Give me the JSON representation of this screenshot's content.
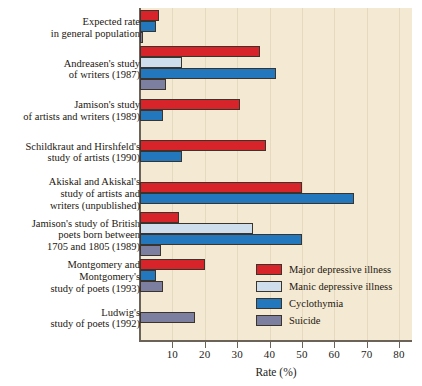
{
  "chart_data": {
    "type": "bar",
    "orientation": "horizontal",
    "title": "",
    "xlabel": "Rate (%)",
    "ylabel": "",
    "xlim": [
      0,
      84
    ],
    "xticks": [
      10,
      20,
      30,
      40,
      50,
      60,
      70,
      80
    ],
    "grid": true,
    "legend_position": "inside-right",
    "categories": [
      "Expected rate\nin general population",
      "Andreasen's study\nof writers (1987)",
      "Jamison's study\nof artists and writers (1989)",
      "Schildkraut and Hirshfeld's\nstudy of artists (1990)",
      "Akiskal and Akiskal's\nstudy of artists and\nwriters  (unpublished)",
      "Jamison's study of British\npoets born between\n1705 and 1805 (1989)",
      "Montgomery and\nMontgomery's\nstudy of poets (1993)",
      "Ludwig's\nstudy of poets (1992)"
    ],
    "series": [
      {
        "name": "Major depressive illness",
        "color": "#d7232a",
        "key": "major",
        "values": [
          6,
          37,
          31,
          39,
          50,
          12,
          20,
          0
        ]
      },
      {
        "name": "Manic depressive illness",
        "color": "#cedeec",
        "key": "manic",
        "values": [
          0,
          13,
          0,
          0,
          0,
          35,
          0,
          0
        ]
      },
      {
        "name": "Cyclothymia",
        "color": "#2277bd",
        "key": "cyclo",
        "values": [
          5,
          42,
          7,
          13,
          66,
          50,
          5,
          0
        ]
      },
      {
        "name": "Suicide",
        "color": "#7c7f9f",
        "key": "suicide",
        "values": [
          1,
          8,
          0,
          0,
          0,
          6.5,
          7,
          17
        ]
      }
    ]
  },
  "legend": {
    "items": [
      {
        "label": "Major depressive illness",
        "key": "major"
      },
      {
        "label": "Manic depressive illness",
        "key": "manic"
      },
      {
        "label": "Cyclothymia",
        "key": "cyclo"
      },
      {
        "label": "Suicide",
        "key": "suicide"
      }
    ]
  },
  "colors": {
    "background": "#f4e9d2",
    "page": "#ffffff",
    "axis": "#6b6357",
    "gridline": "#e5d9bf",
    "bar_outline": "#3a342c",
    "text": "#1c1710",
    "major": "#d7232a",
    "manic": "#cedeec",
    "cyclo": "#2277bd",
    "suicide": "#7c7f9f"
  }
}
